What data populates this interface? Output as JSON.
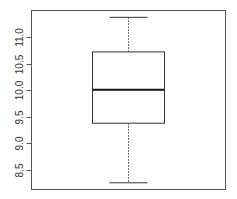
{
  "chart_data": {
    "type": "boxplot",
    "title": "",
    "xlabel": "",
    "ylabel": "",
    "ylim": [
      8.15,
      11.5
    ],
    "yticks": [
      8.5,
      9.0,
      9.5,
      10.0,
      10.5,
      11.0
    ],
    "ytick_labels": [
      "8.5",
      "9.0",
      "9.5",
      "10.0",
      "10.5",
      "11.0"
    ],
    "grid": false,
    "legend": "none",
    "boxes": [
      {
        "name": "",
        "whisker_low": 8.26,
        "q1": 9.38,
        "median": 10.01,
        "q3": 10.72,
        "whisker_high": 11.37
      }
    ]
  }
}
